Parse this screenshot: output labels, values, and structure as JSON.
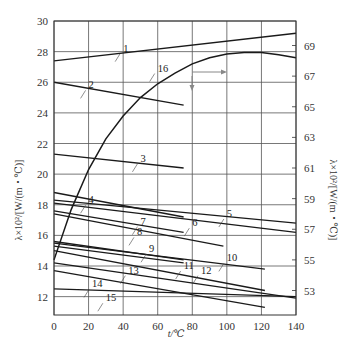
{
  "chart_data": {
    "type": "line",
    "title": "",
    "xlabel": "t/℃",
    "ylabel_left": "λ×10²/[W/(m・℃)]",
    "ylabel_right": "λ×10²/[W/(m・℃)]",
    "xlim": [
      0,
      140
    ],
    "ylim_left": [
      10.8,
      30
    ],
    "ylim_right": [
      51.4,
      70.6
    ],
    "x_ticks": [
      "0",
      "20",
      "40",
      "60",
      "80",
      "100",
      "120",
      "140"
    ],
    "y_ticks_left": [
      "12",
      "14",
      "16",
      "18",
      "20",
      "22",
      "24",
      "26",
      "28",
      "30"
    ],
    "y_ticks_right": [
      "53",
      "55",
      "57",
      "59",
      "61",
      "63",
      "65",
      "67",
      "69"
    ],
    "grid": true,
    "legend": "none (curves numbered inline)",
    "series": [
      {
        "name": "1",
        "axis": "left",
        "x": [
          0,
          140
        ],
        "y": [
          27.4,
          29.2
        ],
        "label_at": [
          40,
          28.0
        ]
      },
      {
        "name": "2",
        "axis": "left",
        "x": [
          0,
          75
        ],
        "y": [
          26.0,
          24.5
        ],
        "label_at": [
          20,
          25.6
        ]
      },
      {
        "name": "3",
        "axis": "left",
        "x": [
          0,
          75
        ],
        "y": [
          21.3,
          20.4
        ],
        "label_at": [
          50,
          20.8
        ]
      },
      {
        "name": "4",
        "axis": "left",
        "x": [
          0,
          75
        ],
        "y": [
          18.8,
          17.2
        ],
        "label_at": [
          20,
          18.1
        ]
      },
      {
        "name": "5",
        "axis": "left",
        "x": [
          0,
          140
        ],
        "y": [
          18.3,
          16.8
        ],
        "label_at": [
          100,
          17.2
        ]
      },
      {
        "name": "6",
        "axis": "left",
        "x": [
          0,
          140
        ],
        "y": [
          18.1,
          16.2
        ],
        "label_at": [
          80,
          16.6
        ]
      },
      {
        "name": "7",
        "axis": "left",
        "x": [
          0,
          75
        ],
        "y": [
          17.6,
          16.2
        ],
        "label_at": [
          50,
          16.7
        ]
      },
      {
        "name": "8",
        "axis": "left",
        "x": [
          0,
          98
        ],
        "y": [
          17.4,
          15.3
        ],
        "label_at": [
          48,
          16.0
        ]
      },
      {
        "name": "9",
        "axis": "left",
        "x": [
          0,
          75
        ],
        "y": [
          15.6,
          14.4
        ],
        "label_at": [
          55,
          14.9
        ]
      },
      {
        "name": "10",
        "axis": "left",
        "x": [
          0,
          122
        ],
        "y": [
          15.5,
          13.8
        ],
        "label_at": [
          100,
          14.3
        ]
      },
      {
        "name": "11",
        "axis": "left",
        "x": [
          0,
          75
        ],
        "y": [
          15.3,
          14.2
        ],
        "label_at": [
          75,
          13.8
        ]
      },
      {
        "name": "12",
        "axis": "left",
        "x": [
          0,
          122
        ],
        "y": [
          15.0,
          12.4
        ],
        "label_at": [
          85,
          13.5
        ]
      },
      {
        "name": "13",
        "axis": "left",
        "x": [
          0,
          140
        ],
        "y": [
          14.2,
          11.9
        ],
        "label_at": [
          43,
          13.5
        ]
      },
      {
        "name": "14",
        "axis": "left",
        "x": [
          0,
          140
        ],
        "y": [
          12.5,
          12.0
        ],
        "label_at": [
          22,
          12.6
        ]
      },
      {
        "name": "15",
        "axis": "left",
        "x": [
          0,
          122
        ],
        "y": [
          13.7,
          11.3
        ],
        "label_at": [
          30,
          11.7
        ]
      },
      {
        "name": "16",
        "axis": "right",
        "x": [
          0,
          10,
          20,
          30,
          40,
          50,
          60,
          70,
          80,
          90,
          100,
          110,
          120,
          130,
          140
        ],
        "y": [
          55.0,
          58.3,
          60.9,
          62.9,
          64.4,
          65.6,
          66.5,
          67.2,
          67.8,
          68.2,
          68.45,
          68.55,
          68.55,
          68.4,
          68.2
        ],
        "label_at": [
          60,
          67.3
        ],
        "axis_indicator": "arrow points to right axis"
      }
    ]
  }
}
